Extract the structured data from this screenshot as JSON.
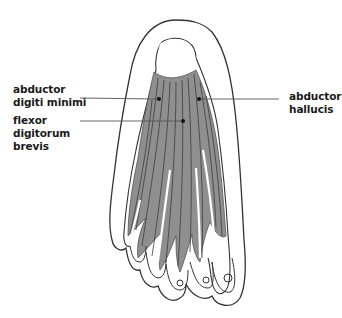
{
  "diagram": {
    "labels": [
      {
        "id": "abductor-digiti-minimi",
        "lines": [
          "abductor",
          "digiti minimi"
        ],
        "side": "left"
      },
      {
        "id": "flexor-digitorum-brevis",
        "lines": [
          "flexor",
          "digitorum",
          "brevis"
        ],
        "side": "left"
      },
      {
        "id": "abductor-hallucis",
        "lines": [
          "abductor",
          "hallucis"
        ],
        "side": "right"
      }
    ],
    "colors": {
      "outline": "#333333",
      "muscle_fill": "#8f8f8f",
      "muscle_dark": "#6a6a6a",
      "leader_line": "#555555",
      "background": "#ffffff"
    }
  }
}
